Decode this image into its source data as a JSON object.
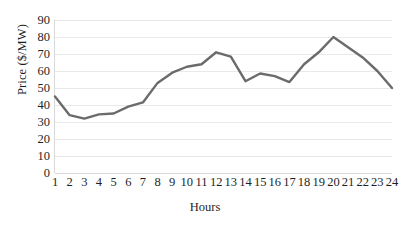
{
  "chart_data": {
    "type": "line",
    "title": "",
    "xlabel": "Hours",
    "ylabel": "Price ($/MW)",
    "categories": [
      "1",
      "2",
      "3",
      "4",
      "5",
      "6",
      "7",
      "8",
      "9",
      "10",
      "11",
      "12",
      "13",
      "14",
      "15",
      "16",
      "17",
      "18",
      "19",
      "20",
      "21",
      "22",
      "23",
      "24"
    ],
    "x": [
      1,
      2,
      3,
      4,
      5,
      6,
      7,
      8,
      9,
      10,
      11,
      12,
      13,
      14,
      15,
      16,
      17,
      18,
      19,
      20,
      21,
      22,
      23,
      24
    ],
    "series": [
      {
        "name": "Price",
        "color": "#6b6b6b",
        "values": [
          45,
          34,
          32,
          34.5,
          35,
          39,
          41.5,
          53,
          59,
          62.5,
          64,
          71,
          68.5,
          54,
          58.5,
          57,
          53.5,
          64,
          71,
          80,
          74,
          68,
          60,
          50
        ]
      }
    ],
    "ylim": [
      0,
      90
    ],
    "ytick_values": [
      0,
      10,
      20,
      30,
      40,
      50,
      60,
      70,
      80,
      90
    ],
    "ytick_labels": [
      "0",
      "10",
      "20",
      "30",
      "40",
      "50",
      "60",
      "70",
      "80",
      "90"
    ],
    "xlim": [
      1,
      24
    ],
    "grid": true,
    "grid_axis": "y",
    "legend": false,
    "legend_position": "none",
    "line_width": 2.4,
    "markers": false,
    "background": "#ffffff",
    "grid_color": "#e9e9e9"
  }
}
